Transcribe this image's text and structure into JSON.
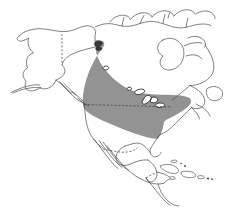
{
  "figure": {
    "kind": "range-map",
    "title": "North America distribution map",
    "width": 232,
    "height": 217,
    "background_color": "#ffffff"
  },
  "legend_colors": {
    "range_shading": "#939393",
    "coastline": "#4a4a4a",
    "political_border": "#3d3d3d",
    "lake_fill": "#ffffff",
    "lake_outline": "#2b2b2b"
  },
  "map": {
    "projection_note": "North America, Alaska through Central America and Caribbean",
    "landmasses": [
      {
        "name": "alaska",
        "label": "Alaska"
      },
      {
        "name": "canada-mainland",
        "label": "Canada"
      },
      {
        "name": "united-states",
        "label": "United States"
      },
      {
        "name": "mexico",
        "label": "Mexico"
      },
      {
        "name": "central-america",
        "label": "Central America"
      },
      {
        "name": "arctic-islands",
        "label": "Canadian Arctic Archipelago"
      },
      {
        "name": "cuba",
        "label": "Cuba"
      },
      {
        "name": "hispaniola",
        "label": "Hispaniola"
      },
      {
        "name": "newfoundland",
        "label": "Newfoundland"
      },
      {
        "name": "vancouver-island",
        "label": "Vancouver Island"
      }
    ],
    "water_bodies": [
      {
        "name": "hudson-bay",
        "label": "Hudson Bay"
      },
      {
        "name": "great-lakes",
        "label": "Great Lakes"
      },
      {
        "name": "great-slave-lake",
        "label": "Great Slave Lake"
      },
      {
        "name": "lake-winnipeg",
        "label": "Lake Winnipeg"
      }
    ],
    "borders": [
      {
        "name": "alaska-canada-border",
        "style": "dashed"
      },
      {
        "name": "usa-canada-border",
        "style": "dashed"
      },
      {
        "name": "usa-mexico-border",
        "style": "dashed"
      }
    ],
    "range_overlay": {
      "name": "species-range-band",
      "description": "Continuous shaded band extending from the Alaska panhandle and coastal British Columbia southeast across the boreal interior and Great Lakes to the eastern United States seaboard",
      "fill": "#939393",
      "opacity": 1
    }
  }
}
